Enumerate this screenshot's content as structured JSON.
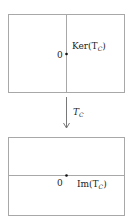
{
  "diagram": {
    "top_box": {
      "origin_label": "0",
      "subspace_label": "Ker(T",
      "subscript": "C",
      "close": ")",
      "line": "vertical"
    },
    "arrow": {
      "label": "T",
      "subscript": "C"
    },
    "bottom_box": {
      "origin_label": "0",
      "subspace_label": "Im(T",
      "subscript": "C",
      "close": ")",
      "line": "horizontal"
    },
    "colors": {
      "box_stroke": "#a8a8a8",
      "line_stroke": "#a8a8a8",
      "arrow": "#555555",
      "text": "#222222"
    }
  }
}
